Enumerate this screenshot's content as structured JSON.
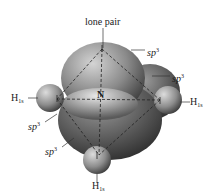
{
  "diagram": {
    "center_atom": "N",
    "labels": {
      "lone_pair": "lone pair",
      "sp3_base": "sp",
      "sp3_exp": "3",
      "h_base": "H",
      "h_sub": "1s",
      "n": "N"
    },
    "orbital_labels": [
      {
        "id": "sp3-top-right",
        "text": "sp3"
      },
      {
        "id": "sp3-right",
        "text": "sp3"
      },
      {
        "id": "sp3-left",
        "text": "sp3"
      },
      {
        "id": "sp3-bottom-left",
        "text": "sp3"
      }
    ],
    "hydrogen_labels": [
      {
        "id": "h-left",
        "text": "H1s"
      },
      {
        "id": "h-right",
        "text": "H1s"
      },
      {
        "id": "h-bottom",
        "text": "H1s"
      }
    ],
    "colors": {
      "lobe_light": "#bdbdbd",
      "lobe_dark": "#4a4a4a",
      "h_light": "#c8c8c8",
      "h_dark": "#555555",
      "leader": "#333333",
      "dash": "#222222"
    }
  }
}
